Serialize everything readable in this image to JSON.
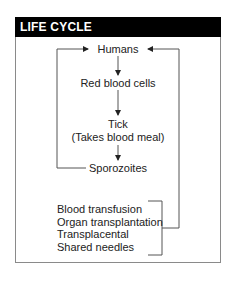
{
  "header": {
    "title": "LIFE CYCLE"
  },
  "nodes": {
    "humans": "Humans",
    "rbc": "Red blood cells",
    "tick": "Tick",
    "tick_note": "(Takes blood meal)",
    "sporozoites": "Sporozoites"
  },
  "other_routes": [
    "Blood transfusion",
    "Organ transplantation",
    "Transplacental",
    "Shared needles"
  ]
}
